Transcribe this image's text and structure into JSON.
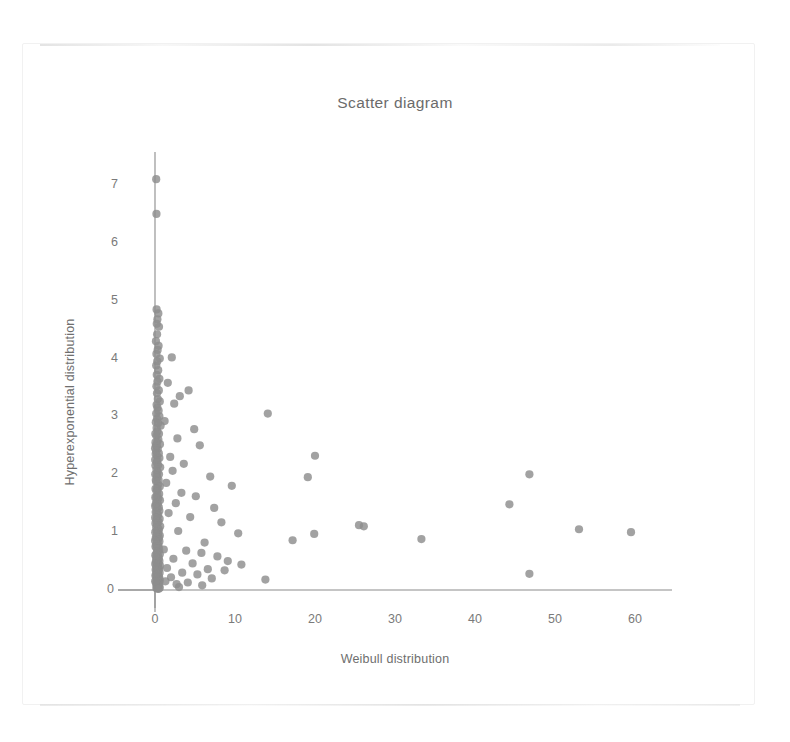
{
  "chart_data": {
    "type": "scatter",
    "title": "Scatter diagram",
    "xlabel": "Weibull distribution",
    "ylabel": "Hyperexponential distribution",
    "xlim": [
      0,
      64
    ],
    "ylim": [
      0,
      7.6
    ],
    "xticks": [
      0,
      10,
      20,
      30,
      40,
      50,
      60
    ],
    "yticks": [
      0,
      1,
      2,
      3,
      4,
      5,
      6,
      7
    ],
    "grid": false,
    "legend": null,
    "marker": {
      "shape": "circle",
      "color": "#8e8e8e",
      "radius_px": 4.1,
      "opacity": 0.82
    },
    "axis_color": "#8b8b8b",
    "points": [
      [
        0.15,
        7.1
      ],
      [
        0.18,
        6.5
      ],
      [
        0.2,
        4.85
      ],
      [
        0.42,
        4.78
      ],
      [
        0.3,
        4.68
      ],
      [
        0.22,
        4.6
      ],
      [
        0.5,
        4.55
      ],
      [
        0.26,
        4.42
      ],
      [
        0.12,
        4.3
      ],
      [
        0.45,
        4.22
      ],
      [
        0.33,
        4.15
      ],
      [
        0.18,
        4.08
      ],
      [
        0.6,
        4.0
      ],
      [
        0.28,
        3.95
      ],
      [
        0.15,
        3.88
      ],
      [
        2.1,
        4.02
      ],
      [
        0.4,
        3.8
      ],
      [
        0.22,
        3.72
      ],
      [
        0.55,
        3.65
      ],
      [
        0.3,
        3.6
      ],
      [
        1.6,
        3.58
      ],
      [
        4.2,
        3.45
      ],
      [
        0.18,
        3.52
      ],
      [
        0.48,
        3.45
      ],
      [
        0.25,
        3.4
      ],
      [
        3.1,
        3.35
      ],
      [
        0.35,
        3.3
      ],
      [
        0.6,
        3.26
      ],
      [
        0.2,
        3.2
      ],
      [
        2.4,
        3.22
      ],
      [
        0.3,
        3.15
      ],
      [
        0.45,
        3.1
      ],
      [
        0.15,
        3.05
      ],
      [
        14.1,
        3.05
      ],
      [
        0.55,
        3.0
      ],
      [
        0.25,
        2.96
      ],
      [
        1.2,
        2.92
      ],
      [
        0.38,
        2.88
      ],
      [
        0.7,
        2.84
      ],
      [
        0.2,
        2.8
      ],
      [
        4.9,
        2.78
      ],
      [
        0.3,
        2.74
      ],
      [
        0.5,
        2.7
      ],
      [
        0.18,
        2.66
      ],
      [
        2.8,
        2.62
      ],
      [
        0.42,
        2.6
      ],
      [
        0.28,
        2.56
      ],
      [
        0.62,
        2.52
      ],
      [
        0.22,
        2.48
      ],
      [
        5.6,
        2.5
      ],
      [
        0.35,
        2.44
      ],
      [
        0.15,
        2.4
      ],
      [
        20.0,
        2.32
      ],
      [
        0.48,
        2.36
      ],
      [
        0.25,
        2.32
      ],
      [
        1.9,
        2.3
      ],
      [
        0.55,
        2.28
      ],
      [
        0.3,
        2.24
      ],
      [
        0.2,
        2.2
      ],
      [
        3.6,
        2.18
      ],
      [
        0.4,
        2.16
      ],
      [
        0.65,
        2.12
      ],
      [
        0.18,
        2.08
      ],
      [
        2.2,
        2.06
      ],
      [
        0.32,
        2.04
      ],
      [
        0.5,
        2.0
      ],
      [
        46.8,
        2.0
      ],
      [
        0.22,
        1.98
      ],
      [
        6.9,
        1.96
      ],
      [
        0.28,
        1.94
      ],
      [
        19.1,
        1.95
      ],
      [
        0.45,
        1.9
      ],
      [
        0.15,
        1.87
      ],
      [
        1.4,
        1.85
      ],
      [
        0.38,
        1.82
      ],
      [
        0.6,
        1.79
      ],
      [
        0.25,
        1.76
      ],
      [
        9.6,
        1.8
      ],
      [
        0.33,
        1.73
      ],
      [
        0.2,
        1.7
      ],
      [
        3.3,
        1.68
      ],
      [
        0.52,
        1.66
      ],
      [
        0.3,
        1.63
      ],
      [
        0.18,
        1.6
      ],
      [
        5.1,
        1.62
      ],
      [
        0.42,
        1.58
      ],
      [
        0.62,
        1.55
      ],
      [
        0.24,
        1.52
      ],
      [
        2.6,
        1.5
      ],
      [
        0.36,
        1.48
      ],
      [
        44.3,
        1.48
      ],
      [
        0.15,
        1.45
      ],
      [
        0.48,
        1.43
      ],
      [
        0.28,
        1.4
      ],
      [
        7.4,
        1.42
      ],
      [
        0.55,
        1.37
      ],
      [
        0.2,
        1.35
      ],
      [
        1.7,
        1.33
      ],
      [
        0.4,
        1.3
      ],
      [
        0.32,
        1.28
      ],
      [
        0.22,
        1.25
      ],
      [
        4.4,
        1.26
      ],
      [
        0.58,
        1.23
      ],
      [
        0.18,
        1.2
      ],
      [
        0.45,
        1.18
      ],
      [
        0.3,
        1.15
      ],
      [
        8.3,
        1.17
      ],
      [
        0.25,
        1.12
      ],
      [
        0.65,
        1.1
      ],
      [
        0.15,
        1.08
      ],
      [
        25.5,
        1.12
      ],
      [
        26.1,
        1.1
      ],
      [
        0.38,
        1.06
      ],
      [
        0.5,
        1.04
      ],
      [
        0.2,
        1.02
      ],
      [
        53.0,
        1.05
      ],
      [
        59.5,
        1.0
      ],
      [
        0.28,
        1.0
      ],
      [
        2.9,
        1.02
      ],
      [
        0.42,
        0.98
      ],
      [
        0.33,
        0.96
      ],
      [
        0.6,
        0.94
      ],
      [
        0.18,
        0.92
      ],
      [
        10.4,
        0.98
      ],
      [
        0.48,
        0.9
      ],
      [
        0.25,
        0.88
      ],
      [
        19.9,
        0.97
      ],
      [
        33.3,
        0.88
      ],
      [
        0.35,
        0.86
      ],
      [
        0.55,
        0.84
      ],
      [
        0.22,
        0.82
      ],
      [
        17.2,
        0.86
      ],
      [
        0.3,
        0.8
      ],
      [
        0.15,
        0.78
      ],
      [
        6.2,
        0.82
      ],
      [
        0.45,
        0.76
      ],
      [
        0.4,
        0.74
      ],
      [
        0.2,
        0.72
      ],
      [
        1.1,
        0.7
      ],
      [
        0.52,
        0.69
      ],
      [
        0.28,
        0.67
      ],
      [
        3.9,
        0.68
      ],
      [
        0.33,
        0.65
      ],
      [
        0.18,
        0.63
      ],
      [
        5.8,
        0.64
      ],
      [
        0.6,
        0.62
      ],
      [
        0.25,
        0.6
      ],
      [
        0.38,
        0.58
      ],
      [
        0.15,
        0.56
      ],
      [
        7.8,
        0.58
      ],
      [
        0.48,
        0.55
      ],
      [
        0.3,
        0.53
      ],
      [
        2.3,
        0.54
      ],
      [
        0.22,
        0.51
      ],
      [
        0.55,
        0.5
      ],
      [
        0.35,
        0.48
      ],
      [
        9.1,
        0.5
      ],
      [
        0.2,
        0.46
      ],
      [
        0.42,
        0.45
      ],
      [
        4.7,
        0.46
      ],
      [
        0.28,
        0.43
      ],
      [
        0.62,
        0.42
      ],
      [
        0.15,
        0.4
      ],
      [
        10.8,
        0.44
      ],
      [
        0.32,
        0.39
      ],
      [
        0.5,
        0.37
      ],
      [
        1.5,
        0.38
      ],
      [
        0.25,
        0.36
      ],
      [
        6.6,
        0.36
      ],
      [
        0.45,
        0.34
      ],
      [
        0.18,
        0.33
      ],
      [
        8.7,
        0.34
      ],
      [
        0.38,
        0.31
      ],
      [
        0.58,
        0.3
      ],
      [
        0.22,
        0.29
      ],
      [
        3.4,
        0.3
      ],
      [
        46.8,
        0.28
      ],
      [
        0.3,
        0.27
      ],
      [
        0.15,
        0.26
      ],
      [
        5.3,
        0.27
      ],
      [
        0.48,
        0.24
      ],
      [
        0.35,
        0.23
      ],
      [
        0.2,
        0.22
      ],
      [
        2.0,
        0.22
      ],
      [
        0.55,
        0.2
      ],
      [
        0.26,
        0.19
      ],
      [
        7.1,
        0.2
      ],
      [
        0.4,
        0.18
      ],
      [
        0.18,
        0.17
      ],
      [
        13.8,
        0.18
      ],
      [
        0.6,
        0.16
      ],
      [
        0.3,
        0.15
      ],
      [
        1.3,
        0.15
      ],
      [
        0.22,
        0.13
      ],
      [
        0.45,
        0.12
      ],
      [
        4.1,
        0.13
      ],
      [
        0.15,
        0.11
      ],
      [
        0.52,
        0.1
      ],
      [
        0.28,
        0.09
      ],
      [
        2.7,
        0.1
      ],
      [
        0.35,
        0.08
      ],
      [
        0.2,
        0.07
      ],
      [
        5.9,
        0.08
      ],
      [
        0.42,
        0.06
      ],
      [
        0.25,
        0.05
      ],
      [
        0.6,
        0.04
      ],
      [
        0.18,
        0.03
      ],
      [
        3.0,
        0.05
      ],
      [
        0.33,
        0.02
      ],
      [
        0.48,
        0.02
      ],
      [
        0.12,
        0.5
      ],
      [
        0.12,
        1.5
      ],
      [
        0.12,
        2.5
      ],
      [
        0.1,
        0.9
      ],
      [
        0.1,
        1.9
      ],
      [
        0.1,
        2.9
      ],
      [
        0.08,
        0.35
      ],
      [
        0.08,
        1.35
      ],
      [
        0.08,
        2.35
      ],
      [
        0.06,
        0.75
      ],
      [
        0.06,
        1.75
      ],
      [
        0.06,
        2.55
      ],
      [
        0.05,
        1.15
      ],
      [
        0.05,
        2.15
      ],
      [
        0.05,
        0.25
      ],
      [
        0.04,
        1.6
      ],
      [
        0.04,
        2.7
      ],
      [
        0.04,
        0.6
      ],
      [
        0.03,
        1.0
      ],
      [
        0.03,
        2.0
      ],
      [
        0.03,
        0.45
      ],
      [
        0.02,
        1.25
      ],
      [
        0.02,
        2.25
      ],
      [
        0.02,
        0.15
      ],
      [
        0.01,
        1.45
      ],
      [
        0.01,
        0.85
      ],
      [
        0.01,
        2.45
      ]
    ]
  },
  "axis_titles": {
    "x": "Weibull distribution",
    "y": "Hyperexponential distribution"
  },
  "title": "Scatter diagram",
  "x_tick_labels": [
    "0",
    "10",
    "20",
    "30",
    "40",
    "50",
    "60"
  ],
  "y_tick_labels": [
    "0",
    "1",
    "2",
    "3",
    "4",
    "5",
    "6",
    "7"
  ]
}
